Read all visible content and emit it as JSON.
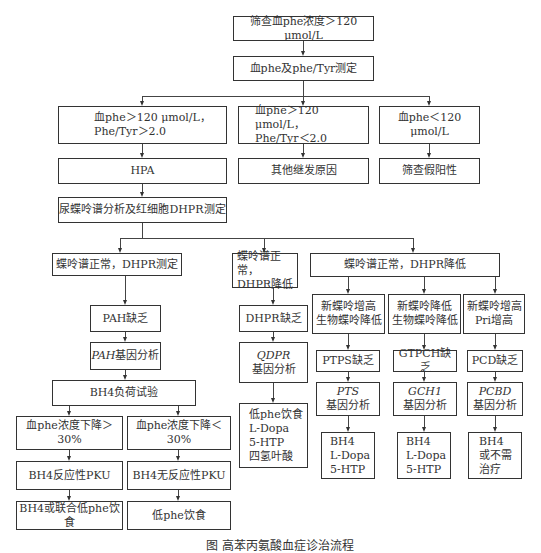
{
  "flowchart": {
    "screen": "筛查血phe浓度＞120 μmol/L",
    "measure": "血phe及phe/Tyr测定",
    "branch_a": "血phe＞120 μmol/L，\nPhe/Tyr＞2.0",
    "branch_b": "血phe＞120 μmol/L，\nPhe/Tyr＜2.0",
    "branch_c": "血phe＜120 μmol/L",
    "hpa": "HPA",
    "other_cause": "其他继发原因",
    "false_positive": "筛查假阳性",
    "pterin_dhpr": "尿蝶呤谱分析及红细胞DHPR测定",
    "pterin_normal_dhpr_test": "蝶呤谱正常，DHPR测定",
    "pterin_normal_dhpr_low_small": "蝶呤谱正常，\nDHPR降低",
    "pterin_normal_dhpr_low_big": "蝶呤谱正常，DHPR降低",
    "pah_def": "PAH缺乏",
    "pah_gene_italic": "PAH",
    "pah_gene_rest": "基因分析",
    "bh4_load": "BH4负荷试验",
    "drop_gt30": "血phe浓度下降＞30%",
    "drop_lt30": "血phe浓度下降＜30%",
    "bh4_responsive": "BH4反应性PKU",
    "bh4_nonresponsive": "BH4无反应性PKU",
    "treat_bh4_diet": "BH4或联合低phe饮食",
    "treat_low_diet": "低phe饮食",
    "dhpr_def": "DHPR缺乏",
    "qdpr_gene_italic": "QDPR",
    "qdpr_gene_rest": "基因分析",
    "dhpr_treat": "低phe饮食\nL-Dopa\n5-HTP\n四氢叶酸",
    "sub1": "新蝶呤增高\n生物蝶呤降低",
    "sub2": "新蝶呤降低\n生物蝶呤降低",
    "sub3": "新蝶呤增高\nPri增高",
    "ptps_def": "PTPS缺乏",
    "gtpch_def": "GTPCH缺乏",
    "pcd_def": "PCD缺乏",
    "pts_gene_italic": "PTS",
    "gch1_gene_italic": "GCH1",
    "pcbd_gene_italic": "PCBD",
    "gene_rest": "基因分析",
    "treat_ptps": "BH4\nL-Dopa\n5-HTP",
    "treat_gtpch": "BH4\nL-Dopa\n5-HTP",
    "treat_pcd": "BH4\n或不需\n治疗"
  },
  "caption": "图 高苯丙氨酸血症诊治流程"
}
